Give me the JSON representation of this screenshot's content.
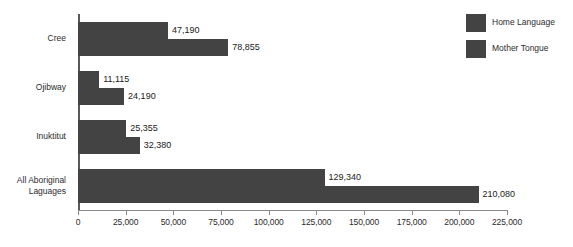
{
  "chart_data": {
    "type": "bar",
    "orientation": "horizontal",
    "title": "",
    "subtitle": "",
    "xlabel": "",
    "ylabel": "",
    "xlim": [
      0,
      225000
    ],
    "grid": false,
    "legend_position": "top-right",
    "categories": [
      "Cree",
      "Ojibway",
      "Inuktitut",
      "All Aboriginal\nLaguages"
    ],
    "tick_labels": [
      "0",
      "25,000",
      "50,000",
      "75,000",
      "100,000",
      "125,000",
      "150,000",
      "175,000",
      "200,000",
      "225,000"
    ],
    "tick_values": [
      0,
      25000,
      50000,
      75000,
      100000,
      125000,
      150000,
      175000,
      200000,
      225000
    ],
    "series": [
      {
        "name": "Home Language",
        "color": "#434343",
        "values": [
          47190,
          11115,
          25355,
          129340
        ],
        "value_labels": [
          "47,190",
          "11,115",
          "25,355",
          "129,340"
        ]
      },
      {
        "name": "Mother Tongue",
        "color": "#434343",
        "values": [
          78855,
          24190,
          32380,
          210080
        ],
        "value_labels": [
          "78,855",
          "24,190",
          "32,380",
          "210,080"
        ]
      }
    ]
  },
  "legend": {
    "items": [
      {
        "label": "Home Language",
        "color": "#434343"
      },
      {
        "label": "Mother Tongue",
        "color": "#434343"
      }
    ]
  },
  "colors": {
    "bar": "#434343",
    "axis": "#8a8a8a",
    "axis_y": "#595959",
    "text": "#2b2b2b",
    "background": "#ffffff"
  }
}
